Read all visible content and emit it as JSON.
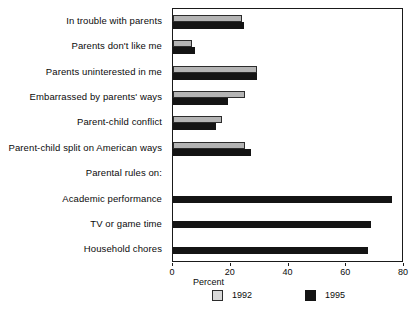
{
  "chart_data": {
    "type": "bar",
    "orientation": "horizontal",
    "title": "",
    "xlabel": "Percent",
    "ylabel": "",
    "xlim": [
      0,
      80
    ],
    "xticks": [
      0,
      20,
      40,
      60,
      80
    ],
    "grid": false,
    "legend_position": "bottom",
    "categories": [
      "In trouble with parents",
      "Parents don't like me",
      "Parents uninterested in me",
      "Embarrassed by parents' ways",
      "Parent-child conflict",
      "Parent-child split on American ways",
      "Parental rules on:",
      "Academic performance",
      "TV or game time",
      "Household chores"
    ],
    "series": [
      {
        "name": "1992",
        "color": "#b4b4b4",
        "values": [
          24,
          6.5,
          29,
          25,
          17,
          25,
          null,
          null,
          null,
          null
        ]
      },
      {
        "name": "1995",
        "color": "#141414",
        "values": [
          24.5,
          7.5,
          29,
          19,
          15,
          27,
          null,
          76,
          68.5,
          67.5
        ]
      }
    ]
  },
  "axis": {
    "tick_labels": [
      "0",
      "20",
      "40",
      "60",
      "80"
    ],
    "title": "Percent"
  },
  "legend": {
    "entries": [
      {
        "label": "1992",
        "swatch": "light-gray-square"
      },
      {
        "label": "1995",
        "swatch": "black-square"
      }
    ]
  }
}
